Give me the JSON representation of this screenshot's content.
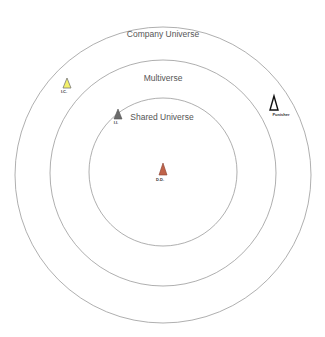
{
  "rings": [
    {
      "label": "Company Universe",
      "cx": 163,
      "cy": 175,
      "r": 148
    },
    {
      "label": "Multiverse",
      "cx": 163,
      "cy": 173,
      "r": 113
    },
    {
      "label": "Shared Universe",
      "cx": 163,
      "cy": 172,
      "r": 74
    }
  ],
  "markers": [
    {
      "label": "I.C.",
      "x": 67,
      "y": 87,
      "fill": "#f3f06a",
      "stroke": "#555555"
    },
    {
      "label": "I.I.",
      "x": 118,
      "y": 116,
      "fill": "#6b6b6b",
      "stroke": "#555555"
    },
    {
      "label": "Punisher",
      "x": 275,
      "y": 103,
      "fill": "#ffffff",
      "stroke": "#111111"
    },
    {
      "label": "D.D.",
      "x": 163,
      "y": 172,
      "fill": "#c0634a",
      "stroke": "#8a4030"
    }
  ],
  "colors": {
    "ring_stroke": "#9a9a9a",
    "label_text": "#555555"
  }
}
